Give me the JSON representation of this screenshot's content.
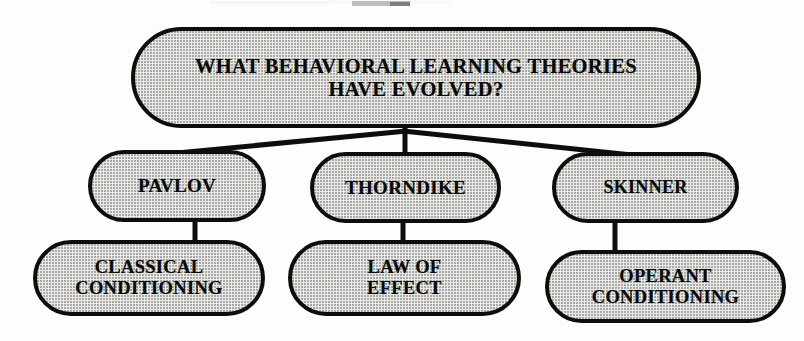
{
  "diagram": {
    "title_text": "WHAT BEHAVIORAL  LEARNING THEORIES HAVE EVOLVED?",
    "type": "hierarchy-tree",
    "style": {
      "node_fill": "#e9e9e7",
      "node_border": "#0d0d0d",
      "text_color": "#0a0a0a",
      "background": "#fdfdfc"
    },
    "root": {
      "id": "root",
      "line1": "WHAT BEHAVIORAL  LEARNING THEORIES",
      "line2": "HAVE EVOLVED?"
    },
    "theorists": [
      {
        "id": "pavlov",
        "label": "PAVLOV"
      },
      {
        "id": "thorndike",
        "label": "THORNDIKE"
      },
      {
        "id": "skinner",
        "label": "SKINNER"
      }
    ],
    "theories": [
      {
        "id": "classical",
        "line1": "CLASSICAL",
        "line2": "CONDITIONING",
        "parent": "pavlov"
      },
      {
        "id": "law",
        "line1": "LAW OF",
        "line2": "EFFECT",
        "parent": "thorndike"
      },
      {
        "id": "operant",
        "line1": "OPERANT",
        "line2": "CONDITIONING",
        "parent": "skinner"
      }
    ],
    "connections": [
      {
        "from": "root",
        "to": "pavlov"
      },
      {
        "from": "root",
        "to": "thorndike"
      },
      {
        "from": "root",
        "to": "skinner"
      },
      {
        "from": "pavlov",
        "to": "classical"
      },
      {
        "from": "thorndike",
        "to": "law"
      },
      {
        "from": "skinner",
        "to": "operant"
      }
    ]
  }
}
